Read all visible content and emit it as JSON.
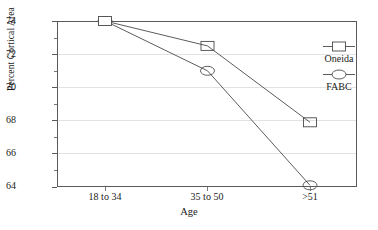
{
  "chart_data": {
    "type": "line",
    "title": "",
    "xlabel": "Age",
    "ylabel": "Percent Cortical Area",
    "categories": [
      "18 to 34",
      "35 to 50",
      ">51"
    ],
    "series": [
      {
        "name": "Oneida",
        "marker": "square",
        "values": [
          74.0,
          72.5,
          67.9
        ]
      },
      {
        "name": "FABC",
        "marker": "ellipse",
        "values": [
          74.0,
          71.0,
          64.1
        ]
      }
    ],
    "ylim": [
      64,
      74
    ],
    "yticks": [
      64,
      66,
      68,
      70,
      72,
      74
    ],
    "ytick_labels": [
      "64",
      "66",
      "68",
      "70",
      "72",
      "74"
    ],
    "gridlines": [
      66,
      68,
      70,
      72
    ],
    "grid": true,
    "legend_position": "right",
    "line_color": "#4a4a4a",
    "grid_color": "#e2e2e2",
    "axis_color": "#5a5a5a"
  },
  "legend": {
    "entries": [
      {
        "label": "Oneida",
        "marker": "square"
      },
      {
        "label": "FABC",
        "marker": "ellipse"
      }
    ]
  }
}
